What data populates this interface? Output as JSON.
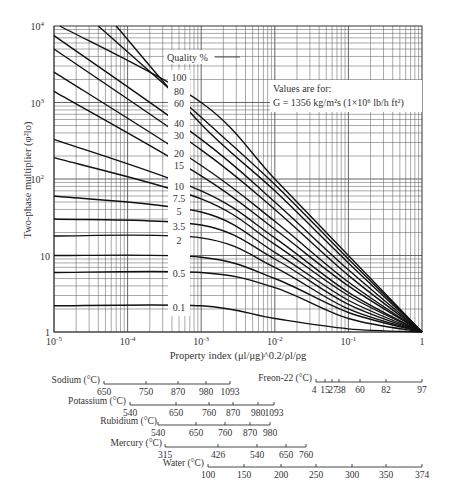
{
  "chart_data": {
    "type": "line",
    "title": "",
    "xlabel": "Property index (μl/μg)^0.2/ρl/ρg",
    "ylabel": "Two-phase multiplier (φ²lo)",
    "xscale": "log",
    "yscale": "log",
    "xlim": [
      1e-05,
      1
    ],
    "ylim": [
      1,
      10000
    ],
    "x_ticks": [
      "10^-5",
      "10^-4",
      "10^-3",
      "10^-2",
      "10^-1",
      "1"
    ],
    "y_ticks": [
      "1",
      "10",
      "10^2",
      "10^3",
      "10^4"
    ],
    "grid": true,
    "legend_title": "Quality %",
    "annotation": {
      "line1": "Values are for:",
      "line2": "G = 1356 kg/m²s (1×10⁶ lb/h ft²)"
    },
    "series": [
      {
        "name": "100",
        "points": [
          [
            1.2e-05,
            10000
          ],
          [
            0.001,
            1000
          ],
          [
            0.01,
            100
          ],
          [
            0.1,
            10
          ],
          [
            1,
            1
          ]
        ]
      },
      {
        "name": "80",
        "points": [
          [
            4e-05,
            10000
          ],
          [
            0.001,
            640
          ],
          [
            0.01,
            85
          ],
          [
            0.1,
            9
          ],
          [
            1,
            1
          ]
        ]
      },
      {
        "name": "60",
        "points": [
          [
            7e-05,
            10000
          ],
          [
            0.001,
            520
          ],
          [
            0.01,
            70
          ],
          [
            0.1,
            8
          ],
          [
            1,
            1
          ]
        ]
      },
      {
        "name": "40",
        "points": [
          [
            1e-05,
            7500
          ],
          [
            0.001,
            330
          ],
          [
            0.01,
            50
          ],
          [
            0.1,
            6.5
          ],
          [
            1,
            1
          ]
        ]
      },
      {
        "name": "30",
        "points": [
          [
            1e-05,
            5000
          ],
          [
            0.001,
            240
          ],
          [
            0.01,
            40
          ],
          [
            0.1,
            5.5
          ],
          [
            1,
            1
          ]
        ]
      },
      {
        "name": "20",
        "points": [
          [
            1e-05,
            2500
          ],
          [
            0.001,
            150
          ],
          [
            0.01,
            28
          ],
          [
            0.1,
            4.5
          ],
          [
            1,
            1
          ]
        ]
      },
      {
        "name": "15",
        "points": [
          [
            1e-05,
            1400
          ],
          [
            0.001,
            110
          ],
          [
            0.01,
            22
          ],
          [
            0.1,
            4
          ],
          [
            1,
            1
          ]
        ]
      },
      {
        "name": "10",
        "points": [
          [
            1e-05,
            330
          ],
          [
            0.001,
            70
          ],
          [
            0.01,
            17
          ],
          [
            0.1,
            3.3
          ],
          [
            1,
            1
          ]
        ]
      },
      {
        "name": "7.5",
        "points": [
          [
            1e-05,
            190
          ],
          [
            0.001,
            55
          ],
          [
            0.01,
            14
          ],
          [
            0.1,
            3
          ],
          [
            1,
            1
          ]
        ]
      },
      {
        "name": "5",
        "points": [
          [
            1e-05,
            60
          ],
          [
            0.001,
            37
          ],
          [
            0.01,
            11
          ],
          [
            0.1,
            2.6
          ],
          [
            1,
            1
          ]
        ]
      },
      {
        "name": "3.5",
        "points": [
          [
            1e-05,
            30
          ],
          [
            0.001,
            25
          ],
          [
            0.01,
            9
          ],
          [
            0.1,
            2.3
          ],
          [
            1,
            1
          ]
        ]
      },
      {
        "name": "2",
        "points": [
          [
            1e-05,
            18
          ],
          [
            0.001,
            17
          ],
          [
            0.01,
            7
          ],
          [
            0.1,
            2
          ],
          [
            1,
            1
          ]
        ]
      },
      {
        "name": "1",
        "points": [
          [
            1e-05,
            10
          ],
          [
            0.001,
            9.5
          ],
          [
            0.01,
            5
          ],
          [
            0.1,
            1.8
          ],
          [
            1,
            1
          ]
        ]
      },
      {
        "name": "0.5",
        "points": [
          [
            1e-05,
            6
          ],
          [
            0.001,
            6
          ],
          [
            0.01,
            3.8
          ],
          [
            0.1,
            1.5
          ],
          [
            1,
            1
          ]
        ]
      },
      {
        "name": "0.1",
        "points": [
          [
            1e-05,
            2.2
          ],
          [
            0.001,
            2.2
          ],
          [
            0.01,
            1.5
          ],
          [
            0.1,
            1.1
          ],
          [
            1,
            1
          ]
        ]
      }
    ],
    "curve_labels": [
      "100",
      "80",
      "60",
      "40",
      "30",
      "20",
      "15",
      "10",
      "7.5",
      "5",
      "3.5",
      "2",
      "0.5",
      "0.1"
    ],
    "temperature_scales": [
      {
        "name": "Sodium (°C)",
        "ticks": [
          "650",
          "750",
          "870",
          "980",
          "1093"
        ]
      },
      {
        "name": "Potassium (°C)",
        "ticks": [
          "540",
          "650",
          "760",
          "870",
          "980",
          "1093"
        ]
      },
      {
        "name": "Rubidium (°C)",
        "ticks": [
          "540",
          "650",
          "760",
          "870",
          "980"
        ]
      },
      {
        "name": "Mercury (°C)",
        "ticks": [
          "315",
          "426",
          "540",
          "650",
          "760"
        ]
      },
      {
        "name": "Water (°C)",
        "ticks": [
          "100",
          "150",
          "200",
          "250",
          "300",
          "350",
          "374"
        ]
      },
      {
        "name": "Freon-22 (°C)",
        "ticks": [
          "4",
          "15",
          "27",
          "38",
          "60",
          "82",
          "97"
        ]
      }
    ]
  }
}
